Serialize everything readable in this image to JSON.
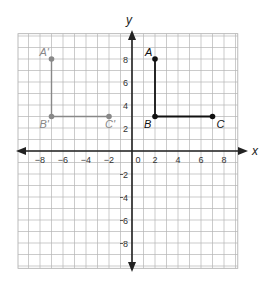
{
  "axes": {
    "x_label": "x",
    "y_label": "y",
    "x_ticks": [
      "−8",
      "−6",
      "−4",
      "−2",
      "0",
      "2",
      "4",
      "6",
      "8"
    ],
    "y_ticks_pos": [
      "2",
      "4",
      "6",
      "8"
    ],
    "y_ticks_neg": [
      "2",
      "4",
      "6",
      "8"
    ]
  },
  "figures": {
    "original": {
      "color": "#111111",
      "points": [
        {
          "label": "A",
          "x": 2,
          "y": 8
        },
        {
          "label": "B",
          "x": 2,
          "y": 3
        },
        {
          "label": "C",
          "x": 7,
          "y": 3
        }
      ]
    },
    "image": {
      "color": "#888888",
      "points": [
        {
          "label": "A'",
          "x": -7,
          "y": 8
        },
        {
          "label": "B'",
          "x": -7,
          "y": 3
        },
        {
          "label": "C'",
          "x": -2,
          "y": 3
        }
      ]
    }
  }
}
